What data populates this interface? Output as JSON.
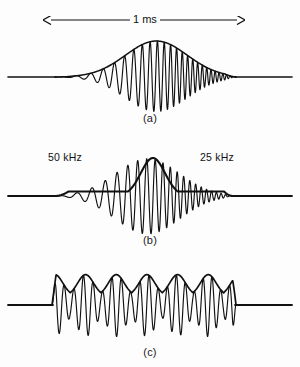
{
  "figure": {
    "background_color": "#fdfdfd",
    "stroke_color": "#111111"
  },
  "scale": {
    "label": "1 ms",
    "arrow_name": "double-headed-arrow",
    "x_start": 50,
    "x_end": 238
  },
  "panels": [
    {
      "id": "a",
      "caption": "(a)",
      "envelope": "gaussian-bell",
      "baseline_y": 77,
      "signal_start_x": 55,
      "signal_end_x": 236,
      "cycles": 26,
      "peak_amplitude": 36,
      "chirp": "down",
      "labels": []
    },
    {
      "id": "b",
      "caption": "(b)",
      "envelope": "compressed-peak-with-pedestal",
      "baseline_y": 196,
      "signal_start_x": 55,
      "signal_end_x": 233,
      "cycles": 22,
      "peak_amplitude": 38,
      "chirp": "down",
      "labels": [
        {
          "text": "50 kHz",
          "x": 48,
          "y": 151
        },
        {
          "text": "25 kHz",
          "x": 200,
          "y": 151
        }
      ]
    },
    {
      "id": "c",
      "caption": "(c)",
      "envelope": "rippled-multilobe",
      "baseline_y": 305,
      "signal_start_x": 52,
      "signal_end_x": 236,
      "cycles": 20,
      "lobes": 6,
      "peak_amplitude": 33,
      "chirp": "none",
      "labels": []
    }
  ],
  "chart_data": {
    "type": "line",
    "xlabel": "",
    "ylabel": "",
    "annotations": [
      "1 ms",
      "50 kHz",
      "25 kHz"
    ],
    "series": [
      {
        "name": "(a)",
        "envelope": "gaussian-bell",
        "cycles": 26
      },
      {
        "name": "(b)",
        "envelope": "compressed-peak-with-pedestal",
        "cycles": 22
      },
      {
        "name": "(c)",
        "envelope": "rippled-multilobe",
        "cycles": 20,
        "lobes": 6
      }
    ]
  }
}
